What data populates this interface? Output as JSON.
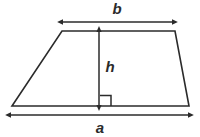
{
  "figure": {
    "name": "trapezoid-area-diagram",
    "background_color": "#ffffff",
    "stroke_color": "#2b2b2b",
    "label_color": "#2b2b2b",
    "shape": {
      "name": "trapezoid",
      "top_left": [
        62,
        31
      ],
      "top_right": [
        175,
        31
      ],
      "bottom_right": [
        189,
        106
      ],
      "bottom_left": [
        12,
        106
      ]
    },
    "dimensions": [
      {
        "id": "b",
        "label": "b",
        "kind": "double-headed-arrow",
        "orientation": "horizontal",
        "meaning": "top parallel side",
        "from": [
          63,
          22
        ],
        "to": [
          172,
          22
        ],
        "label_position": [
          117,
          14
        ]
      },
      {
        "id": "h",
        "label": "h",
        "kind": "double-headed-arrow",
        "orientation": "vertical",
        "meaning": "height",
        "from": [
          99,
          32
        ],
        "to": [
          99,
          105
        ],
        "label_position": [
          110,
          72
        ]
      },
      {
        "id": "a",
        "label": "a",
        "kind": "double-headed-arrow",
        "orientation": "horizontal",
        "meaning": "bottom parallel side",
        "from": [
          11,
          115
        ],
        "to": [
          188,
          115
        ],
        "label_position": [
          100,
          133
        ]
      }
    ],
    "right_angle_marker": {
      "name": "right-angle-marker",
      "corner": [
        99,
        106
      ],
      "size": 11
    }
  }
}
